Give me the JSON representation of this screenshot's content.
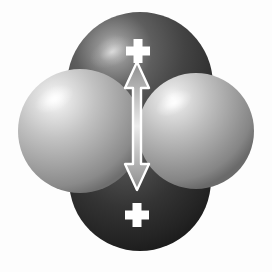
{
  "figure": {
    "title": "Orbital lobe diagram with vertical double-headed arrow",
    "background_color": "#fdfdfd",
    "width": 272,
    "height": 272
  },
  "lobes": {
    "top": {
      "name": "top-dark-lobe",
      "cx": 140,
      "cy": 85,
      "r": 73,
      "fill_color": "#4f4f4f",
      "highlight_color": "#b9b9b9",
      "shade_color": "#2b2b2b",
      "sign_label": "+",
      "sign_x": 138,
      "sign_y": 46,
      "sign_color": "#ffffff"
    },
    "bottom": {
      "name": "bottom-dark-lobe",
      "cx": 140,
      "cy": 180,
      "r": 73,
      "fill_color": "#3a3a3a",
      "highlight_color": "#6e6e6e",
      "shade_color": "#161616",
      "sign_label": "+",
      "sign_x": 137,
      "sign_y": 211,
      "sign_color": "#ffffff"
    },
    "left": {
      "name": "left-light-lobe",
      "cx": 80,
      "cy": 131,
      "r": 62,
      "fill_color": "#b5b5b5",
      "highlight_color": "#f2f2f2",
      "shade_color": "#6c6c6c"
    },
    "right": {
      "name": "right-light-lobe",
      "cx": 196,
      "cy": 131,
      "r": 58,
      "fill_color": "#b0b0b0",
      "highlight_color": "#f0f0f0",
      "shade_color": "#6a6a6a"
    }
  },
  "arrow": {
    "name": "vertical-double-arrow",
    "x": 137,
    "top_y": 62,
    "bottom_y": 190,
    "shaft_width": 8,
    "head_width": 24,
    "head_height": 26,
    "outline_color": "#ffffff",
    "fill_top_color": "#8d8d8d",
    "fill_mid_color": "#e8e8e8",
    "fill_bottom_color": "#8a8a8a",
    "direction": "double-headed-vertical"
  }
}
